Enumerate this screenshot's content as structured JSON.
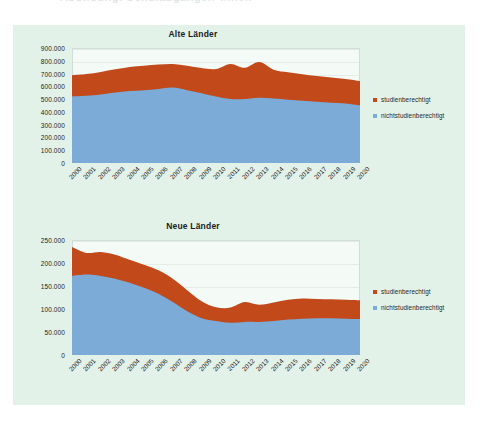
{
  "page": {
    "top_cut_text": "Abbildung: Schulabgänger/-innen"
  },
  "colors": {
    "studienberechtigt": "#c1491a",
    "nichtstudienberechtigt": "#7cabd8",
    "panel_background": "#e3f2e9",
    "plot_background": "#f4faf6",
    "grid": "#e4ece7",
    "text": "#1d1d1d"
  },
  "legend": {
    "items": [
      {
        "label": "studienberechtigt",
        "color": "#c1491a"
      },
      {
        "label": "nichtstudienberechtigt",
        "color": "#7cabd8"
      }
    ]
  },
  "charts": [
    {
      "key": "alte",
      "title": "Alte Länder",
      "yticks": [
        "900.000",
        "800.000",
        "700.000",
        "600.000",
        "500.000",
        "400.000",
        "300.000",
        "200.000",
        "100.000",
        "0"
      ]
    },
    {
      "key": "neue",
      "title": "Neue Länder",
      "yticks": [
        "250.000",
        "200.000",
        "150.000",
        "100.000",
        "50.000",
        "0"
      ]
    }
  ],
  "chart_data": [
    {
      "type": "area",
      "stacked": true,
      "title": "Alte Länder",
      "xlabel": "",
      "ylabel": "",
      "ylim": [
        0,
        900000
      ],
      "ytick_step": 100000,
      "grid": true,
      "legend_position": "right",
      "categories": [
        "2000",
        "2001",
        "2002",
        "2003",
        "2004",
        "2005",
        "2006",
        "2007",
        "2008",
        "2009",
        "2010",
        "2011",
        "2012",
        "2013",
        "2014",
        "2015",
        "2016",
        "2017",
        "2018",
        "2019",
        "2020"
      ],
      "series": [
        {
          "name": "nichtstudienberechtigt",
          "color": "#7cabd8",
          "values": [
            521000,
            526000,
            537000,
            551000,
            563000,
            570000,
            580000,
            590000,
            570000,
            545000,
            520000,
            500000,
            500000,
            510000,
            505000,
            495000,
            488000,
            480000,
            472000,
            466000,
            452000
          ]
        },
        {
          "name": "studienberechtigt",
          "color": "#c1491a",
          "values": [
            166000,
            170000,
            176000,
            182000,
            189000,
            192000,
            190000,
            185000,
            192000,
            198000,
            215000,
            275000,
            245000,
            280000,
            225000,
            215000,
            207000,
            200000,
            198000,
            192000,
            190000
          ]
        }
      ],
      "totals": [
        687000,
        696000,
        713000,
        733000,
        752000,
        762000,
        770000,
        775000,
        762000,
        743000,
        735000,
        775000,
        745000,
        790000,
        730000,
        710000,
        695000,
        680000,
        670000,
        658000,
        642000
      ]
    },
    {
      "type": "area",
      "stacked": true,
      "title": "Neue Länder",
      "xlabel": "",
      "ylabel": "",
      "ylim": [
        0,
        250000
      ],
      "ytick_step": 50000,
      "grid": true,
      "legend_position": "right",
      "categories": [
        "2000",
        "2001",
        "2002",
        "2003",
        "2004",
        "2005",
        "2006",
        "2007",
        "2008",
        "2009",
        "2010",
        "2011",
        "2012",
        "2013",
        "2014",
        "2015",
        "2016",
        "2017",
        "2018",
        "2019",
        "2020"
      ],
      "series": [
        {
          "name": "nichtstudienberechtigt",
          "color": "#7cabd8",
          "values": [
            172000,
            175000,
            172000,
            166000,
            157000,
            146000,
            133000,
            115000,
            95000,
            80000,
            74000,
            70000,
            72000,
            72000,
            74000,
            77000,
            79000,
            80000,
            80000,
            79000,
            78000
          ]
        },
        {
          "name": "studienberechtigt",
          "color": "#c1491a",
          "values": [
            63000,
            47000,
            52000,
            52000,
            50000,
            50000,
            51000,
            51000,
            46000,
            37000,
            30000,
            33000,
            43000,
            37000,
            40000,
            43000,
            44000,
            42000,
            41000,
            41000,
            41000
          ]
        }
      ],
      "totals": [
        235000,
        222000,
        224000,
        218000,
        207000,
        196000,
        184000,
        166000,
        141000,
        117000,
        104000,
        103000,
        115000,
        109000,
        114000,
        120000,
        123000,
        122000,
        121000,
        120000,
        119000
      ]
    }
  ]
}
